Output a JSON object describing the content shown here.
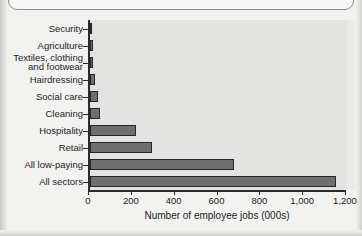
{
  "chart_data": {
    "type": "bar",
    "orientation": "horizontal",
    "title": "",
    "xlabel": "Number of employee jobs (000s)",
    "ylabel": "",
    "xlim": [
      0,
      1200
    ],
    "xticks": [
      0,
      200,
      400,
      600,
      800,
      1000,
      1200
    ],
    "xtick_labels": [
      "0",
      "200",
      "400",
      "600",
      "800",
      "1,000",
      "1,200"
    ],
    "grid": false,
    "legend": false,
    "categories": [
      "Security",
      "Agriculture",
      "Textiles, clothing\nand footwear",
      "Hairdressing",
      "Social care",
      "Cleaning",
      "Hospitality",
      "Retail",
      "All low-paying",
      "All sectors"
    ],
    "values": [
      10,
      12,
      13,
      22,
      36,
      48,
      215,
      290,
      672,
      1150
    ],
    "bar_color": "#6f6f6f",
    "bar_edge_color": "#262626",
    "plot_background": "#e3e3e1"
  },
  "axis": {
    "x_title": "Number of employee jobs (000s)"
  }
}
